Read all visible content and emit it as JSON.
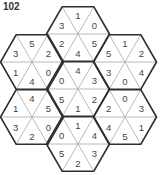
{
  "puzzle": {
    "number": "102",
    "colors": {
      "outline": "#2e2e2e",
      "inner_line": "#a8a8a8",
      "text": "#444444",
      "background": "#ffffff"
    },
    "triangle_order": [
      "top",
      "upper-right",
      "lower-right",
      "bottom",
      "lower-left",
      "upper-left"
    ],
    "hexagons": [
      {
        "name": "hex-top",
        "cx": 78,
        "cy": 34,
        "values": [
          1,
          0,
          5,
          4,
          2,
          3
        ]
      },
      {
        "name": "hex-upper-left",
        "cx": 32,
        "cy": 62,
        "values": [
          5,
          2,
          0,
          4,
          1,
          3
        ]
      },
      {
        "name": "hex-upper-right",
        "cx": 125,
        "cy": 62,
        "values": [
          1,
          2,
          4,
          0,
          3,
          5
        ]
      },
      {
        "name": "hex-center",
        "cx": 78,
        "cy": 89,
        "values": [
          4,
          3,
          2,
          1,
          5,
          0
        ]
      },
      {
        "name": "hex-lower-left",
        "cx": 32,
        "cy": 117,
        "values": [
          4,
          5,
          0,
          2,
          3,
          1
        ]
      },
      {
        "name": "hex-lower-right",
        "cx": 125,
        "cy": 117,
        "values": [
          0,
          3,
          1,
          5,
          4,
          2
        ]
      },
      {
        "name": "hex-bottom",
        "cx": 78,
        "cy": 144,
        "values": [
          1,
          4,
          3,
          2,
          5,
          0
        ]
      }
    ]
  }
}
